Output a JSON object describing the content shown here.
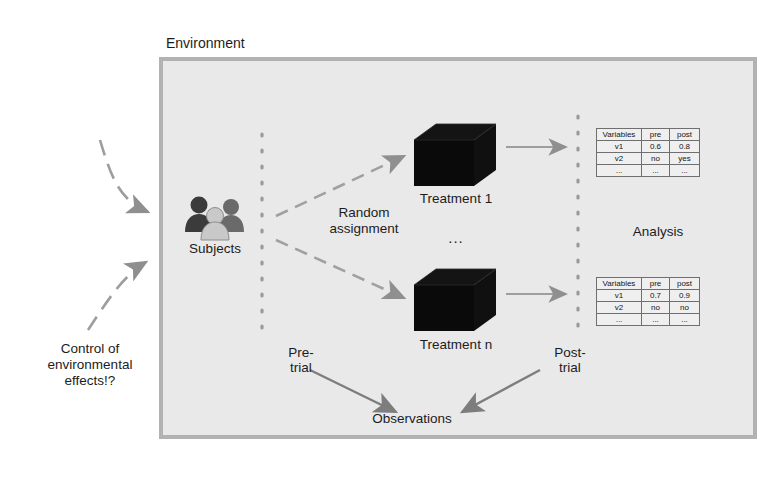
{
  "diagram": {
    "environment_label": "Environment",
    "control_note": "Control of\nenvironmental\neffects!?",
    "subjects_label": "Subjects",
    "random_assignment_label": "Random\nassignment",
    "treatment_first_label": "Treatment 1",
    "treatment_ellipsis": "...",
    "treatment_last_label": "Treatment n",
    "pre_trial_label": "Pre-\ntrial",
    "post_trial_label": "Post-\ntrial",
    "observations_label": "Observations",
    "analysis_label": "Analysis"
  },
  "tables": [
    {
      "name": "treatment-1-results",
      "headers": [
        "Variables",
        "pre",
        "post"
      ],
      "rows": [
        [
          "v1",
          "0.6",
          "0.8"
        ],
        [
          "v2",
          "no",
          "yes"
        ],
        [
          "...",
          "...",
          "..."
        ]
      ]
    },
    {
      "name": "treatment-n-results",
      "headers": [
        "Variables",
        "pre",
        "post"
      ],
      "rows": [
        [
          "v1",
          "0.7",
          "0.9"
        ],
        [
          "v2",
          "no",
          "no"
        ],
        [
          "...",
          "...",
          "..."
        ]
      ]
    }
  ],
  "colors": {
    "page_background": "#ffffff",
    "environment_fill": "#e9e9e9",
    "environment_border": "#b2b2b2",
    "text": "#1c1c1c",
    "arrow_gray": "#8f8f8f",
    "arrow_dark": "#6e6e6e",
    "cube_fill": "#0d0d0d",
    "table_border": "#6f6f6f",
    "dotted_line": "#9a9a9a"
  },
  "icons": {
    "subjects": "people-group-icon",
    "treatment": "black-cube-icon"
  }
}
